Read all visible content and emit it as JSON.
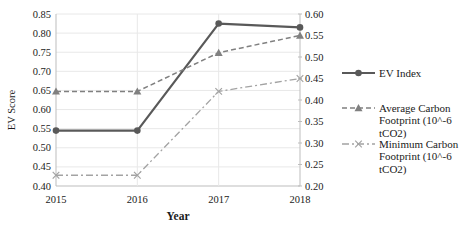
{
  "chart_data": {
    "type": "line",
    "x": [
      "2015",
      "2016",
      "2017",
      "2018"
    ],
    "xlabel": "Year",
    "left_axis": {
      "label": "EV Score",
      "min": 0.4,
      "max": 0.85,
      "step": 0.05,
      "ticks": [
        "0.85",
        "0.80",
        "0.75",
        "0.70",
        "0.65",
        "0.60",
        "0.55",
        "0.50",
        "0.45",
        "0.40"
      ]
    },
    "right_axis": {
      "label": "",
      "min": 0.2,
      "max": 0.6,
      "step": 0.05,
      "ticks": [
        "0.60",
        "0.55",
        "0.50",
        "0.45",
        "0.40",
        "0.35",
        "0.30",
        "0.25",
        "0.20"
      ]
    },
    "grid": "horizontal-and-vertical",
    "legend_position": "right",
    "series": [
      {
        "name": "EV Index",
        "axis": "left",
        "values": [
          0.545,
          0.545,
          0.825,
          0.815
        ],
        "marker": "circle",
        "line": "solid",
        "color": "#595959",
        "width": 2.2
      },
      {
        "name": "Average Carbon Footprint (10^-6 tCO2)",
        "axis": "right",
        "values": [
          0.42,
          0.42,
          0.51,
          0.55
        ],
        "marker": "triangle",
        "line": "dashed",
        "color": "#808080",
        "width": 1.5
      },
      {
        "name": "Minimum Carbon Footprint (10^-6 tCO2)",
        "axis": "right",
        "values": [
          0.225,
          0.225,
          0.42,
          0.45
        ],
        "marker": "x",
        "line": "dashdot",
        "color": "#a3a3a3",
        "width": 1.3
      }
    ],
    "legend": {
      "entries": [
        {
          "label": "EV Index",
          "label_lines": [
            "EV Index"
          ]
        },
        {
          "label": "Average Carbon Footprint (10^-6 tCO2)",
          "label_lines": [
            "Average Carbon",
            "Footprint (10^-6",
            "tCO2)"
          ]
        },
        {
          "label": "Minimum Carbon Footprint (10^-6 tCO2)",
          "label_lines": [
            "Minimum Carbon",
            "Footprint (10^-6",
            "tCO2)"
          ]
        }
      ]
    },
    "colors": {
      "gridline": "#e8e8e8",
      "axis_line": "#bdbdbd",
      "text": "#1a1a1a"
    }
  }
}
